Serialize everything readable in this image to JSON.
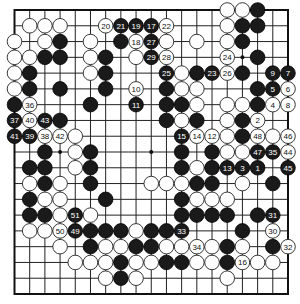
{
  "board": {
    "size": 19,
    "hoshi": [
      [
        3,
        3
      ],
      [
        3,
        9
      ],
      [
        3,
        15
      ],
      [
        9,
        3
      ],
      [
        9,
        9
      ],
      [
        9,
        15
      ],
      [
        15,
        3
      ],
      [
        15,
        9
      ],
      [
        15,
        15
      ]
    ],
    "colors": {
      "black": "#1a1a1a",
      "white": "#ffffff",
      "line": "#222222"
    },
    "stones": [
      {
        "r": 0,
        "c": 14,
        "color": "white"
      },
      {
        "r": 0,
        "c": 15,
        "color": "white"
      },
      {
        "r": 0,
        "c": 16,
        "color": "black"
      },
      {
        "r": 1,
        "c": 1,
        "color": "white"
      },
      {
        "r": 1,
        "c": 2,
        "color": "white"
      },
      {
        "r": 1,
        "c": 3,
        "color": "white"
      },
      {
        "r": 1,
        "c": 6,
        "color": "white",
        "label": "20"
      },
      {
        "r": 1,
        "c": 7,
        "color": "black",
        "label": "21"
      },
      {
        "r": 1,
        "c": 8,
        "color": "black",
        "label": "19"
      },
      {
        "r": 1,
        "c": 9,
        "color": "black",
        "label": "17"
      },
      {
        "r": 1,
        "c": 10,
        "color": "white",
        "label": "22"
      },
      {
        "r": 1,
        "c": 14,
        "color": "white"
      },
      {
        "r": 1,
        "c": 15,
        "color": "black"
      },
      {
        "r": 1,
        "c": 16,
        "color": "black"
      },
      {
        "r": 2,
        "c": 0,
        "color": "white"
      },
      {
        "r": 2,
        "c": 2,
        "color": "white"
      },
      {
        "r": 2,
        "c": 3,
        "color": "black"
      },
      {
        "r": 2,
        "c": 5,
        "color": "white"
      },
      {
        "r": 2,
        "c": 7,
        "color": "black"
      },
      {
        "r": 2,
        "c": 8,
        "color": "white",
        "label": "18"
      },
      {
        "r": 2,
        "c": 9,
        "color": "black",
        "label": "27"
      },
      {
        "r": 2,
        "c": 10,
        "color": "white"
      },
      {
        "r": 2,
        "c": 12,
        "color": "white"
      },
      {
        "r": 2,
        "c": 14,
        "color": "white"
      },
      {
        "r": 2,
        "c": 15,
        "color": "black"
      },
      {
        "r": 3,
        "c": 0,
        "color": "white"
      },
      {
        "r": 3,
        "c": 1,
        "color": "white"
      },
      {
        "r": 3,
        "c": 2,
        "color": "black"
      },
      {
        "r": 3,
        "c": 3,
        "color": "black"
      },
      {
        "r": 3,
        "c": 5,
        "color": "white"
      },
      {
        "r": 3,
        "c": 6,
        "color": "black"
      },
      {
        "r": 3,
        "c": 8,
        "color": "white"
      },
      {
        "r": 3,
        "c": 9,
        "color": "black",
        "label": "29"
      },
      {
        "r": 3,
        "c": 10,
        "color": "white",
        "label": "28"
      },
      {
        "r": 3,
        "c": 14,
        "color": "white",
        "label": "24"
      },
      {
        "r": 3,
        "c": 16,
        "color": "black"
      },
      {
        "r": 4,
        "c": 0,
        "color": "white"
      },
      {
        "r": 4,
        "c": 1,
        "color": "black"
      },
      {
        "r": 4,
        "c": 5,
        "color": "white"
      },
      {
        "r": 4,
        "c": 6,
        "color": "black"
      },
      {
        "r": 4,
        "c": 10,
        "color": "black",
        "label": "25"
      },
      {
        "r": 4,
        "c": 11,
        "color": "white"
      },
      {
        "r": 4,
        "c": 12,
        "color": "black"
      },
      {
        "r": 4,
        "c": 13,
        "color": "black",
        "label": "23"
      },
      {
        "r": 4,
        "c": 14,
        "color": "white",
        "label": "26"
      },
      {
        "r": 4,
        "c": 15,
        "color": "black"
      },
      {
        "r": 4,
        "c": 17,
        "color": "black",
        "label": "9"
      },
      {
        "r": 4,
        "c": 18,
        "color": "black",
        "label": "7"
      },
      {
        "r": 5,
        "c": 0,
        "color": "white"
      },
      {
        "r": 5,
        "c": 1,
        "color": "black"
      },
      {
        "r": 5,
        "c": 3,
        "color": "black"
      },
      {
        "r": 5,
        "c": 6,
        "color": "black"
      },
      {
        "r": 5,
        "c": 8,
        "color": "white",
        "label": "10"
      },
      {
        "r": 5,
        "c": 10,
        "color": "black"
      },
      {
        "r": 5,
        "c": 11,
        "color": "white"
      },
      {
        "r": 5,
        "c": 12,
        "color": "white"
      },
      {
        "r": 5,
        "c": 16,
        "color": "black"
      },
      {
        "r": 5,
        "c": 17,
        "color": "black",
        "label": "5"
      },
      {
        "r": 5,
        "c": 18,
        "color": "white",
        "label": "6"
      },
      {
        "r": 6,
        "c": 0,
        "color": "black"
      },
      {
        "r": 6,
        "c": 1,
        "color": "white",
        "label": "36"
      },
      {
        "r": 6,
        "c": 5,
        "color": "black"
      },
      {
        "r": 6,
        "c": 8,
        "color": "black",
        "label": "11"
      },
      {
        "r": 6,
        "c": 10,
        "color": "black"
      },
      {
        "r": 6,
        "c": 11,
        "color": "black"
      },
      {
        "r": 6,
        "c": 12,
        "color": "white"
      },
      {
        "r": 6,
        "c": 14,
        "color": "white"
      },
      {
        "r": 6,
        "c": 15,
        "color": "white"
      },
      {
        "r": 6,
        "c": 16,
        "color": "black"
      },
      {
        "r": 6,
        "c": 17,
        "color": "white",
        "label": "4"
      },
      {
        "r": 6,
        "c": 18,
        "color": "white",
        "label": "8"
      },
      {
        "r": 7,
        "c": 0,
        "color": "black",
        "label": "37"
      },
      {
        "r": 7,
        "c": 1,
        "color": "white",
        "label": "40"
      },
      {
        "r": 7,
        "c": 2,
        "color": "black",
        "label": "43"
      },
      {
        "r": 7,
        "c": 3,
        "color": "black"
      },
      {
        "r": 7,
        "c": 10,
        "color": "black"
      },
      {
        "r": 7,
        "c": 11,
        "color": "white"
      },
      {
        "r": 7,
        "c": 12,
        "color": "black"
      },
      {
        "r": 7,
        "c": 14,
        "color": "white"
      },
      {
        "r": 7,
        "c": 15,
        "color": "black"
      },
      {
        "r": 7,
        "c": 16,
        "color": "white",
        "label": "2"
      },
      {
        "r": 8,
        "c": 0,
        "color": "black",
        "label": "41"
      },
      {
        "r": 8,
        "c": 1,
        "color": "black",
        "label": "39"
      },
      {
        "r": 8,
        "c": 2,
        "color": "white",
        "label": "38"
      },
      {
        "r": 8,
        "c": 3,
        "color": "white",
        "label": "42"
      },
      {
        "r": 8,
        "c": 4,
        "color": "white"
      },
      {
        "r": 8,
        "c": 11,
        "color": "black",
        "label": "15"
      },
      {
        "r": 8,
        "c": 12,
        "color": "white",
        "label": "14"
      },
      {
        "r": 8,
        "c": 13,
        "color": "white",
        "label": "12"
      },
      {
        "r": 8,
        "c": 14,
        "color": "white"
      },
      {
        "r": 8,
        "c": 15,
        "color": "black"
      },
      {
        "r": 8,
        "c": 16,
        "color": "white",
        "label": "48"
      },
      {
        "r": 8,
        "c": 17,
        "color": "white"
      },
      {
        "r": 8,
        "c": 18,
        "color": "white",
        "label": "46"
      },
      {
        "r": 9,
        "c": 2,
        "color": "black"
      },
      {
        "r": 9,
        "c": 4,
        "color": "white"
      },
      {
        "r": 9,
        "c": 5,
        "color": "black"
      },
      {
        "r": 9,
        "c": 11,
        "color": "black"
      },
      {
        "r": 9,
        "c": 13,
        "color": "black"
      },
      {
        "r": 9,
        "c": 14,
        "color": "white"
      },
      {
        "r": 9,
        "c": 15,
        "color": "white"
      },
      {
        "r": 9,
        "c": 16,
        "color": "black",
        "label": "47"
      },
      {
        "r": 9,
        "c": 17,
        "color": "black",
        "label": "35"
      },
      {
        "r": 9,
        "c": 18,
        "color": "white",
        "label": "44"
      },
      {
        "r": 10,
        "c": 1,
        "color": "black"
      },
      {
        "r": 10,
        "c": 2,
        "color": "black"
      },
      {
        "r": 10,
        "c": 4,
        "color": "white"
      },
      {
        "r": 10,
        "c": 5,
        "color": "black"
      },
      {
        "r": 10,
        "c": 11,
        "color": "black"
      },
      {
        "r": 10,
        "c": 12,
        "color": "white"
      },
      {
        "r": 10,
        "c": 13,
        "color": "black"
      },
      {
        "r": 10,
        "c": 14,
        "color": "black",
        "label": "13"
      },
      {
        "r": 10,
        "c": 15,
        "color": "black",
        "label": "3"
      },
      {
        "r": 10,
        "c": 16,
        "color": "black",
        "label": "1"
      },
      {
        "r": 10,
        "c": 18,
        "color": "black",
        "label": "45"
      },
      {
        "r": 11,
        "c": 1,
        "color": "white"
      },
      {
        "r": 11,
        "c": 2,
        "color": "black"
      },
      {
        "r": 11,
        "c": 3,
        "color": "white"
      },
      {
        "r": 11,
        "c": 5,
        "color": "black"
      },
      {
        "r": 11,
        "c": 9,
        "color": "white"
      },
      {
        "r": 11,
        "c": 10,
        "color": "white"
      },
      {
        "r": 11,
        "c": 11,
        "color": "white"
      },
      {
        "r": 11,
        "c": 12,
        "color": "black"
      },
      {
        "r": 11,
        "c": 13,
        "color": "black"
      },
      {
        "r": 11,
        "c": 15,
        "color": "white"
      },
      {
        "r": 11,
        "c": 17,
        "color": "black"
      },
      {
        "r": 12,
        "c": 1,
        "color": "black"
      },
      {
        "r": 12,
        "c": 2,
        "color": "white"
      },
      {
        "r": 12,
        "c": 3,
        "color": "white"
      },
      {
        "r": 12,
        "c": 6,
        "color": "black"
      },
      {
        "r": 12,
        "c": 11,
        "color": "black"
      },
      {
        "r": 12,
        "c": 12,
        "color": "white"
      },
      {
        "r": 12,
        "c": 13,
        "color": "white"
      },
      {
        "r": 12,
        "c": 14,
        "color": "white"
      },
      {
        "r": 13,
        "c": 1,
        "color": "black"
      },
      {
        "r": 13,
        "c": 2,
        "color": "black"
      },
      {
        "r": 13,
        "c": 3,
        "color": "white"
      },
      {
        "r": 13,
        "c": 4,
        "color": "black",
        "label": "51"
      },
      {
        "r": 13,
        "c": 5,
        "color": "white"
      },
      {
        "r": 13,
        "c": 11,
        "color": "black"
      },
      {
        "r": 13,
        "c": 12,
        "color": "black"
      },
      {
        "r": 13,
        "c": 13,
        "color": "black"
      },
      {
        "r": 13,
        "c": 14,
        "color": "black"
      },
      {
        "r": 13,
        "c": 16,
        "color": "black"
      },
      {
        "r": 13,
        "c": 17,
        "color": "black",
        "label": "31"
      },
      {
        "r": 14,
        "c": 1,
        "color": "white"
      },
      {
        "r": 14,
        "c": 2,
        "color": "white"
      },
      {
        "r": 14,
        "c": 3,
        "color": "white",
        "label": "50"
      },
      {
        "r": 14,
        "c": 4,
        "color": "black",
        "label": "49"
      },
      {
        "r": 14,
        "c": 5,
        "color": "black"
      },
      {
        "r": 14,
        "c": 6,
        "color": "black"
      },
      {
        "r": 14,
        "c": 7,
        "color": "black"
      },
      {
        "r": 14,
        "c": 8,
        "color": "white"
      },
      {
        "r": 14,
        "c": 9,
        "color": "black"
      },
      {
        "r": 14,
        "c": 10,
        "color": "black"
      },
      {
        "r": 14,
        "c": 11,
        "color": "black",
        "label": "33"
      },
      {
        "r": 14,
        "c": 15,
        "color": "black"
      },
      {
        "r": 14,
        "c": 17,
        "color": "white",
        "label": "30"
      },
      {
        "r": 15,
        "c": 3,
        "color": "white"
      },
      {
        "r": 15,
        "c": 5,
        "color": "black"
      },
      {
        "r": 15,
        "c": 6,
        "color": "white"
      },
      {
        "r": 15,
        "c": 7,
        "color": "white"
      },
      {
        "r": 15,
        "c": 8,
        "color": "black"
      },
      {
        "r": 15,
        "c": 9,
        "color": "black"
      },
      {
        "r": 15,
        "c": 10,
        "color": "white"
      },
      {
        "r": 15,
        "c": 11,
        "color": "white"
      },
      {
        "r": 15,
        "c": 12,
        "color": "white",
        "label": "34"
      },
      {
        "r": 15,
        "c": 13,
        "color": "white"
      },
      {
        "r": 15,
        "c": 14,
        "color": "black"
      },
      {
        "r": 15,
        "c": 15,
        "color": "white"
      },
      {
        "r": 15,
        "c": 17,
        "color": "black"
      },
      {
        "r": 15,
        "c": 18,
        "color": "white",
        "label": "32"
      },
      {
        "r": 16,
        "c": 4,
        "color": "white"
      },
      {
        "r": 16,
        "c": 5,
        "color": "white"
      },
      {
        "r": 16,
        "c": 6,
        "color": "white"
      },
      {
        "r": 16,
        "c": 7,
        "color": "black"
      },
      {
        "r": 16,
        "c": 8,
        "color": "white"
      },
      {
        "r": 16,
        "c": 9,
        "color": "white"
      },
      {
        "r": 16,
        "c": 10,
        "color": "black"
      },
      {
        "r": 16,
        "c": 11,
        "color": "black"
      },
      {
        "r": 16,
        "c": 12,
        "color": "white"
      },
      {
        "r": 16,
        "c": 13,
        "color": "white"
      },
      {
        "r": 16,
        "c": 14,
        "color": "black"
      },
      {
        "r": 16,
        "c": 15,
        "color": "white",
        "label": "16"
      },
      {
        "r": 16,
        "c": 16,
        "color": "white"
      },
      {
        "r": 16,
        "c": 17,
        "color": "white"
      },
      {
        "r": 17,
        "c": 6,
        "color": "white"
      },
      {
        "r": 17,
        "c": 7,
        "color": "black"
      },
      {
        "r": 17,
        "c": 8,
        "color": "white"
      },
      {
        "r": 17,
        "c": 14,
        "color": "white"
      }
    ]
  }
}
